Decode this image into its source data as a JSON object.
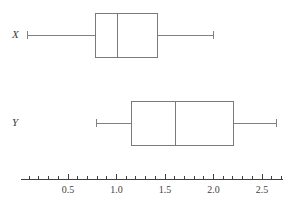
{
  "chart_data": {
    "type": "box",
    "title": "",
    "xlabel": "",
    "ylabel": "",
    "orientation": "horizontal",
    "xlim": [
      0.02,
      2.72
    ],
    "grid": false,
    "legend": "none",
    "axis": {
      "major_ticks": [
        0.5,
        1.0,
        1.5,
        2.0,
        2.5
      ],
      "tick_labels": [
        "0.5",
        "1.0",
        "1.5",
        "2.0",
        "2.5"
      ],
      "minor_tick_step": 0.1,
      "minor_ticks": [
        0.1,
        0.2,
        0.3,
        0.4,
        0.6,
        0.7,
        0.8,
        0.9,
        1.1,
        1.2,
        1.3,
        1.4,
        1.6,
        1.7,
        1.8,
        1.9,
        2.1,
        2.2,
        2.3,
        2.4,
        2.6,
        2.7
      ],
      "line_start": 0.02,
      "line_end": 2.72
    },
    "series": [
      {
        "name": "X",
        "label": "X",
        "min": 0.08,
        "q1": 0.78,
        "median": 1.01,
        "q3": 1.42,
        "max": 2.0
      },
      {
        "name": "Y",
        "label": "Y",
        "min": 0.79,
        "q1": 1.15,
        "median": 1.61,
        "q3": 2.21,
        "max": 2.65
      }
    ],
    "colors": {
      "line": "#808080",
      "box_stroke": "#7a7a7a",
      "axis": "#3f3f3f",
      "text": "#3f3f3f",
      "background": "#ffffff"
    }
  }
}
